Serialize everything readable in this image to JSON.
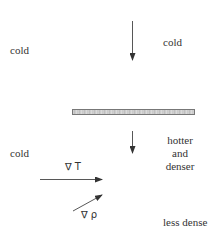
{
  "diagram": {
    "labels": {
      "cold_top_left": "cold",
      "cold_top_right": "cold",
      "cold_bottom_left": "cold",
      "hotter": "hotter",
      "and": "and",
      "denser": "denser",
      "less_dense": "less dense",
      "grad_T": "∇  T",
      "grad_rho": "∇  ρ"
    },
    "elements": {
      "plate": "heated plate",
      "arrow_down_top": "downward flow arrow (above plate)",
      "arrow_down_bottom": "downward flow arrow (below plate)",
      "arrow_grad_T": "temperature gradient arrow",
      "arrow_grad_rho": "density gradient arrow"
    },
    "colors": {
      "line": "#333333",
      "plate_border": "#777777",
      "text": "#333333"
    }
  }
}
